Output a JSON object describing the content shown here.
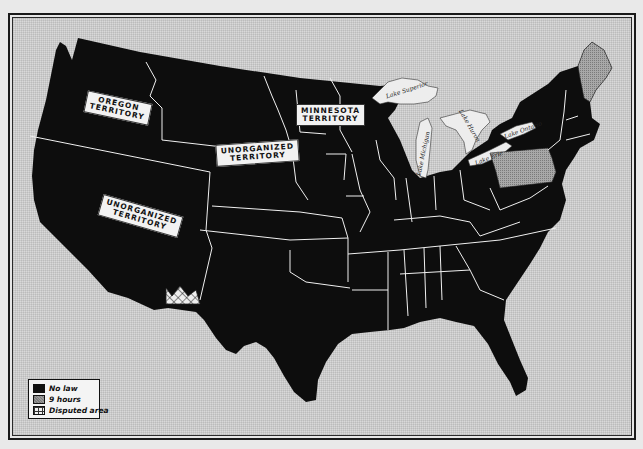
{
  "map": {
    "subject": "United States hours-of-work laws (c. 1840s)",
    "territory_labels": [
      {
        "id": "oregon",
        "text": "OREGON\nTERRITORY"
      },
      {
        "id": "minnesota",
        "text": "MINNESOTA\nTERRITORY"
      },
      {
        "id": "unorganized-north",
        "text": "UNORGANIZED\nTERRITORY"
      },
      {
        "id": "unorganized-west",
        "text": "UNORGANIZED\nTERRITORY"
      }
    ],
    "lakes": [
      {
        "id": "superior",
        "text": "Lake Superior"
      },
      {
        "id": "michigan",
        "text": "Lake Michigan"
      },
      {
        "id": "huron",
        "text": "Lake Huron"
      },
      {
        "id": "erie",
        "text": "Lake Erie"
      },
      {
        "id": "ontario",
        "text": "Lake Ontario"
      }
    ],
    "shaded_states": [
      {
        "name": "Pennsylvania",
        "category": "9 hours"
      },
      {
        "name": "Maine",
        "category": "9 hours"
      }
    ],
    "disputed_area": "Texas/New Mexico border region",
    "colors": {
      "no_law": "#111111",
      "nine_hours": "#9a9a9a",
      "background": "#d9d9d9",
      "border_lines": "#ffffff"
    }
  },
  "legend": {
    "items": [
      {
        "swatch": "no-law",
        "label": "No law"
      },
      {
        "swatch": "9-hours",
        "label": "9 hours"
      },
      {
        "swatch": "disputed",
        "label": "Disputed area"
      }
    ]
  }
}
